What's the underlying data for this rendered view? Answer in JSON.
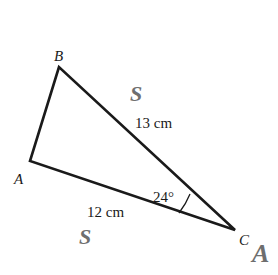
{
  "diagram": {
    "type": "triangle",
    "vertices": {
      "A": {
        "label": "A"
      },
      "B": {
        "label": "B"
      },
      "C": {
        "label": "C"
      }
    },
    "sides": {
      "BC": {
        "length_label": "13 cm",
        "marker": "S"
      },
      "AC": {
        "length_label": "12 cm",
        "marker": "S"
      }
    },
    "angle": {
      "vertex": "C",
      "label": "24°",
      "marker": "A"
    },
    "colors": {
      "line": "#1a1a1a",
      "marker": "#6e6e6e"
    }
  }
}
